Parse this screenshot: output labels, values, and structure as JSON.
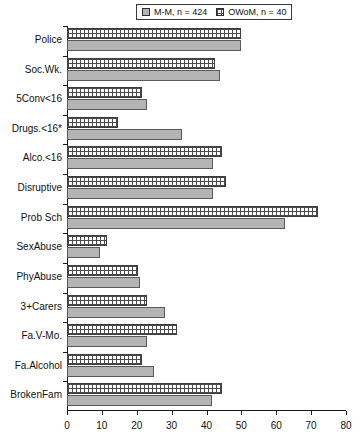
{
  "legend": {
    "entries": [
      {
        "label": "M-M, n = 424",
        "swatch": "solid-gray-swatch",
        "color": "#b4b4b4"
      },
      {
        "label": "OWoM, n = 40",
        "swatch": "crosshatch-swatch",
        "color": "#ffffff"
      }
    ]
  },
  "colors": {
    "series_mm": "#b4b4b4",
    "series_owom": "#ffffff",
    "outline": "#4a4a4a",
    "axis": "#1a1a1a",
    "text": "#111111"
  },
  "chart_data": {
    "type": "bar",
    "orientation": "horizontal",
    "title": "",
    "xlabel": "",
    "ylabel": "",
    "xlim": [
      0,
      80
    ],
    "xticks": [
      0,
      10,
      20,
      30,
      40,
      50,
      60,
      70,
      80
    ],
    "grid": false,
    "legend_position": "top-right",
    "categories": [
      "Police",
      "Soc.Wk.",
      "5Conv<16",
      "Drugs.<16*",
      "Alco.<16",
      "Disruptive",
      "Prob Sch",
      "SexAbuse",
      "PhyAbuse",
      "3+Carers",
      "Fa.V-Mo.",
      "Fa.Alcohol",
      "BrokenFam"
    ],
    "series": [
      {
        "name": "OWoM, n = 40",
        "key": "owom",
        "values": [
          50,
          42.5,
          21.5,
          14.5,
          44.5,
          45.5,
          72,
          11.5,
          20.5,
          23,
          31.5,
          21.5,
          44.5
        ]
      },
      {
        "name": "M-M, n = 424",
        "key": "mm",
        "values": [
          50,
          44,
          23,
          33,
          42,
          42,
          62.5,
          9.5,
          21,
          28,
          23,
          25,
          41.5
        ]
      }
    ]
  }
}
